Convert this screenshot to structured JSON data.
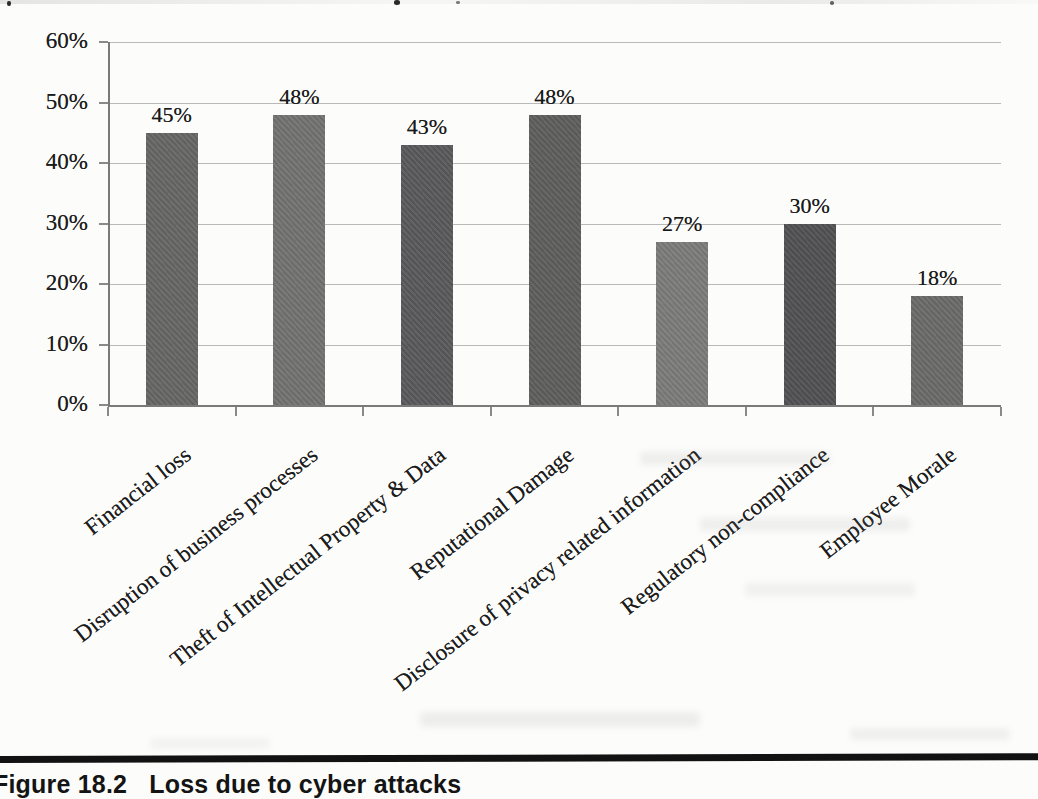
{
  "page": {
    "caption": {
      "figure_label": "Figure 18.2",
      "figure_title": "Loss due to cyber attacks"
    }
  },
  "chart_data": {
    "type": "bar",
    "title": "",
    "xlabel": "",
    "ylabel": "",
    "categories": [
      "Financial loss",
      "Disruption of business processes",
      "Theft of Intellectual Property & Data",
      "Reputational Damage",
      "Disclosure of privacy related information",
      "Regulatory non-compliance",
      "Employee Morale"
    ],
    "values": [
      45,
      48,
      43,
      48,
      27,
      30,
      18
    ],
    "value_labels": [
      "45%",
      "48%",
      "43%",
      "48%",
      "27%",
      "30%",
      "18%"
    ],
    "bar_colors": [
      "#666664",
      "#727270",
      "#59595b",
      "#5e5e5c",
      "#7b7b79",
      "#515153",
      "#6a6a68"
    ],
    "ylim": [
      0,
      60
    ],
    "ytick_labels": [
      "60%",
      "50%",
      "40%",
      "30%",
      "20%",
      "10%",
      "0%"
    ],
    "grid": true,
    "legend": false,
    "gridline_color": "#b9b9b9",
    "axis_color": "#7a7a7a",
    "text_color": "#1c1c1c"
  }
}
